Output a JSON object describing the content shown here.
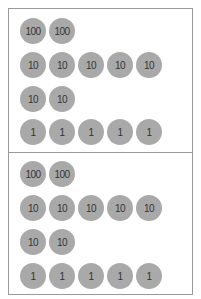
{
  "colors": {
    "disc": "#a9a9a9",
    "border": "#9a9a9a",
    "text": "#333333"
  },
  "panels": [
    {
      "rows": [
        {
          "discs": [
            "100",
            "100"
          ]
        },
        {
          "discs": [
            "10",
            "10",
            "10",
            "10",
            "10"
          ]
        },
        {
          "discs": [
            "10",
            "10"
          ]
        },
        {
          "discs": [
            "1",
            "1",
            "1",
            "1",
            "1"
          ]
        }
      ]
    },
    {
      "rows": [
        {
          "discs": [
            "100",
            "100"
          ]
        },
        {
          "discs": [
            "10",
            "10",
            "10",
            "10",
            "10"
          ]
        },
        {
          "discs": [
            "10",
            "10"
          ]
        },
        {
          "discs": [
            "1",
            "1",
            "1",
            "1",
            "1"
          ]
        }
      ]
    }
  ]
}
